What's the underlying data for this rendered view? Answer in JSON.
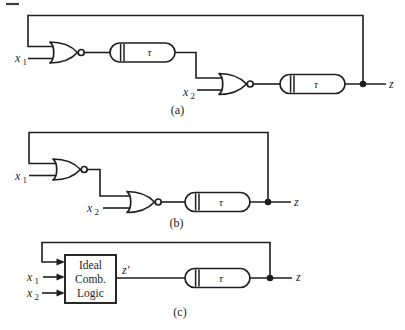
{
  "figure": {
    "background": "#ffffff",
    "ink": "#1e1e1e",
    "parts": {
      "a": {
        "caption": "(a)",
        "x1": {
          "base": "x",
          "sub": "1"
        },
        "x2": {
          "base": "x",
          "sub": "2"
        },
        "delay1_label": "τ",
        "delay2_label": "τ",
        "output_label": "z"
      },
      "b": {
        "caption": "(b)",
        "x1": {
          "base": "x",
          "sub": "1"
        },
        "x2": {
          "base": "x",
          "sub": "2"
        },
        "delay_label": "τ",
        "output_label": "z"
      },
      "c": {
        "caption": "(c)",
        "x1": {
          "base": "x",
          "sub": "1"
        },
        "x2": {
          "base": "x",
          "sub": "2"
        },
        "box": {
          "line1": "Ideal",
          "line2": "Comb.",
          "line3": "Logic"
        },
        "internal_label": "z′",
        "delay_label": "τ",
        "output_label": "z"
      }
    }
  }
}
